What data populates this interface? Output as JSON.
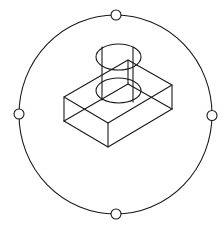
{
  "view": {
    "name": "3D Orbit",
    "background": "#ffffff",
    "line_color": "#1a1a1a"
  },
  "orbit": {
    "arcball": "orbit-ring",
    "handles": [
      "top",
      "right",
      "bottom",
      "left"
    ]
  },
  "model": {
    "type": "wireframe",
    "parts": [
      {
        "name": "box",
        "kind": "rectangular-block"
      },
      {
        "name": "cylinder",
        "kind": "cylinder-boss"
      }
    ]
  }
}
